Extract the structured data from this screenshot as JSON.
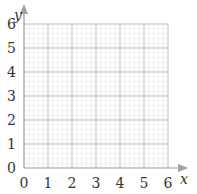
{
  "chart_data": {
    "type": "scatter",
    "title": "",
    "xlabel": "x",
    "ylabel": "y",
    "xlim": [
      0,
      6
    ],
    "ylim": [
      0,
      6
    ],
    "x_ticks": [
      "0",
      "1",
      "2",
      "3",
      "4",
      "5",
      "6"
    ],
    "y_ticks": [
      "0",
      "1",
      "2",
      "3",
      "4",
      "5",
      "6"
    ],
    "grid": true,
    "minor_grid": true,
    "minor_divisions_per_unit": 5,
    "series": [],
    "legend": null
  },
  "colors": {
    "major_grid": "#bdbdbd",
    "minor_grid": "#e6e6e6",
    "axis": "#999999",
    "arrow": "#a0a0a0",
    "text": "#333333"
  }
}
